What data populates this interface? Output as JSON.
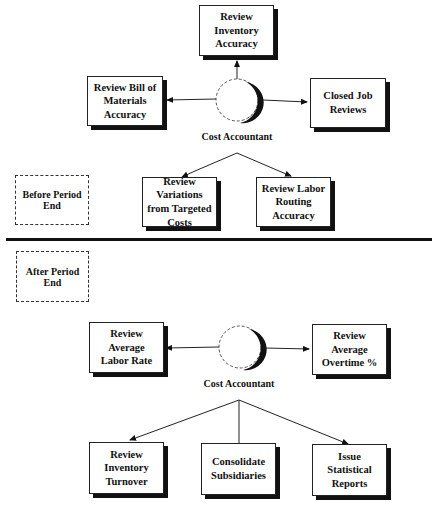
{
  "diagram": {
    "sections": {
      "before": "Before Period End",
      "after": "After Period End"
    },
    "top": {
      "actor": "Cost Accountant",
      "tasks": {
        "up": "Review Inventory Accuracy",
        "left": "Review Bill of Materials Accuracy",
        "right": "Closed Job Reviews",
        "down_left": "Review Variations from Targeted Costs",
        "down_right": "Review Labor Routing Accuracy"
      }
    },
    "bottom": {
      "actor": "Cost Accountant",
      "tasks": {
        "left": "Review Average Labor Rate",
        "right": "Review Average Overtime %",
        "down_left": "Review Inventory Turnover",
        "down_center": "Consolidate Subsidiaries",
        "down_right": "Issue Statistical Reports"
      }
    }
  }
}
